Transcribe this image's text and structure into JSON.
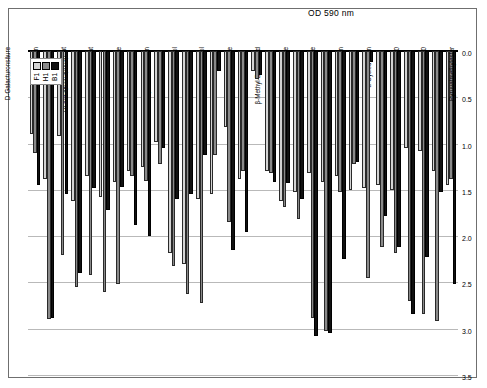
{
  "figure": {
    "frame_border_color": "#6f6f6f",
    "background": "#ffffff"
  },
  "axis": {
    "title": "OD 590 nm",
    "tick_labels": [
      "0.0",
      "0.5",
      "1.0",
      "1.5",
      "2.0",
      "2.5",
      "3.0",
      "3.5"
    ]
  },
  "legend": {
    "entries": [
      {
        "label": "B1",
        "color": "#111111"
      },
      {
        "label": "H1",
        "color": "#8a8a8a"
      },
      {
        "label": "F1",
        "color": "#d4d4d4"
      }
    ]
  },
  "chart_data": {
    "type": "bar",
    "title": "",
    "subtitle": "",
    "xlabel": "",
    "ylabel": "OD 590 nm",
    "ylim": [
      0.0,
      3.5
    ],
    "ytick_values": [
      0.0,
      0.5,
      1.0,
      1.5,
      2.0,
      2.5,
      3.0,
      3.5
    ],
    "grid": true,
    "legend_position": "bottom-left",
    "orientation": "vertical-bars-rotated-90",
    "categories": [
      "Pyruvatmethylester",
      "Tween 40",
      "Tween 80",
      "α-Cyclodextrin",
      "Glycogen",
      "D-Cellobiose",
      "α-D-Lactose",
      "β-Methyl-D-Glucosid",
      "D-Xylose",
      "i-Erythritol",
      "D-Mannitol",
      "N-Acetyl-D-Glucosamin",
      "D-Glucosaminsäure",
      "Glucose-1-Phosphat",
      "DL-α-Glycerolphosphat",
      "D-Galactonsäure γ-Lacton",
      "D-Galacturonsäure",
      "2-Hydroxybenzoesäure",
      "4-Hydroxybenzoesäure",
      "γ-Hydroxybuttersäure",
      "Itaconsäure",
      "α-Ketobuttersäure",
      "D-Milchsäure",
      "L-Arginin",
      "L-Asparagin",
      "L-Phenylalanin",
      "L-Serin",
      "L-Threonin",
      "Glycyl-L-Glutamat",
      "Phenylethylamin",
      "Putrescin"
    ],
    "series": [
      {
        "name": "B1",
        "color": "#111111",
        "values": [
          2.52,
          1.52,
          2.22,
          2.84,
          2.12,
          1.78,
          0.12,
          1.2,
          2.25,
          3.05,
          3.08,
          1.6,
          1.43,
          1.42,
          0.26,
          1.95,
          2.15,
          0.22,
          1.12,
          1.55,
          1.6,
          1.05,
          2.0,
          1.88,
          1.47,
          1.72,
          1.48,
          2.4,
          1.55,
          2.88,
          1.45
        ]
      },
      {
        "name": "H1",
        "color": "#8a8a8a",
        "values": [
          1.38,
          2.92,
          2.84,
          2.7,
          2.18,
          2.12,
          2.45,
          1.22,
          1.52,
          3.02,
          2.88,
          1.82,
          1.68,
          1.32,
          0.3,
          1.3,
          1.85,
          1.12,
          2.72,
          2.62,
          2.32,
          1.22,
          1.4,
          1.35,
          2.52,
          2.6,
          2.42,
          2.55,
          2.2,
          2.9,
          1.1
        ]
      },
      {
        "name": "F1",
        "color": "#d4d4d4",
        "values": [
          1.45,
          1.3,
          1.08,
          1.05,
          1.5,
          1.45,
          1.48,
          1.5,
          1.35,
          1.42,
          1.32,
          1.52,
          1.62,
          1.3,
          0.22,
          1.38,
          0.82,
          1.55,
          1.6,
          2.3,
          2.18,
          0.98,
          1.25,
          1.3,
          1.42,
          1.58,
          1.35,
          1.62,
          0.92,
          1.38,
          0.9
        ]
      }
    ]
  }
}
